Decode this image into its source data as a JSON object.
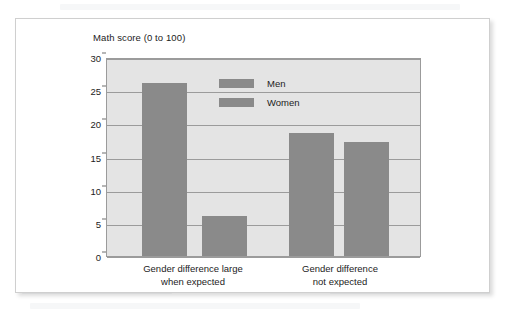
{
  "chart_data": {
    "type": "bar",
    "title": "",
    "ylabel": "Math score (0 to 100)",
    "xlabel": "",
    "ylim": [
      0,
      30
    ],
    "yticks": [
      "0",
      "5",
      "10",
      "15",
      "20",
      "25",
      "30"
    ],
    "grid": true,
    "legend_position": "inside-top-center",
    "categories": [
      "Gender difference large\nwhen expected",
      "Gender difference\nnot expected"
    ],
    "series": [
      {
        "name": "Men",
        "values": [
          26.1,
          18.6
        ]
      },
      {
        "name": "Women",
        "values": [
          6.0,
          17.2
        ]
      }
    ],
    "colors": {
      "bar": "#8a8a8a",
      "plot_background": "#e4e4e4",
      "gridline": "#9b9b9b",
      "card_background": "#ffffff",
      "text": "#1c1c1c"
    }
  },
  "axis": {
    "y_title": "Math score (0 to 100)",
    "ticks": [
      "30",
      "25",
      "20",
      "15",
      "10",
      "5",
      "0"
    ]
  },
  "legend": {
    "items": [
      {
        "label": "Men"
      },
      {
        "label": "Women"
      }
    ]
  },
  "categories": [
    {
      "line1": "Gender difference large",
      "line2": "when expected"
    },
    {
      "line1": "Gender difference",
      "line2": "not expected"
    }
  ]
}
